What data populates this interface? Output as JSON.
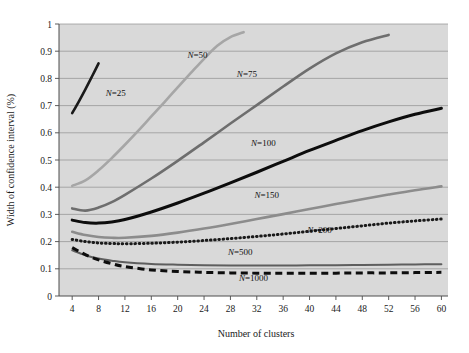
{
  "chart_data": {
    "type": "line",
    "title": "",
    "xlabel": "Number of clusters",
    "ylabel": "Width of confidence interval (%)",
    "xlim": [
      2,
      61
    ],
    "ylim": [
      0,
      1
    ],
    "xticks": [
      4,
      8,
      12,
      16,
      20,
      24,
      28,
      32,
      36,
      40,
      44,
      48,
      52,
      56,
      60
    ],
    "yticks": [
      "0",
      "0.1",
      "0.2",
      "0.3",
      "0.4",
      "0.5",
      "0.6",
      "0.7",
      "0.8",
      "0.9",
      "1"
    ],
    "grid": true,
    "grid_axis": "y",
    "legend": "inline-annotations",
    "plot_background": "#d9d9d9",
    "series": [
      {
        "name": "N=25",
        "label": "N=25",
        "color": "#1a1a1a",
        "style": "solid",
        "width": 2.6,
        "label_x": 10.6,
        "label_y": 0.735,
        "x": [
          4,
          5,
          6,
          7,
          8
        ],
        "values": [
          0.672,
          0.715,
          0.76,
          0.807,
          0.855
        ]
      },
      {
        "name": "N=50",
        "label": "N=50",
        "color": "#a6a6a6",
        "style": "solid",
        "width": 2.6,
        "label_x": 23.0,
        "label_y": 0.875,
        "x": [
          4,
          6,
          8,
          10,
          12,
          14,
          16,
          18,
          20,
          22,
          24,
          26,
          28,
          30
        ],
        "values": [
          0.405,
          0.425,
          0.462,
          0.507,
          0.556,
          0.607,
          0.66,
          0.713,
          0.767,
          0.82,
          0.872,
          0.92,
          0.952,
          0.97
        ]
      },
      {
        "name": "N=75",
        "label": "N=75",
        "color": "#6e6e6e",
        "style": "solid",
        "width": 2.6,
        "label_x": 30.5,
        "label_y": 0.805,
        "x": [
          4,
          6,
          8,
          10,
          12,
          16,
          20,
          24,
          28,
          32,
          36,
          40,
          44,
          48,
          52
        ],
        "values": [
          0.322,
          0.314,
          0.325,
          0.345,
          0.372,
          0.432,
          0.497,
          0.565,
          0.634,
          0.702,
          0.77,
          0.836,
          0.892,
          0.933,
          0.96
        ]
      },
      {
        "name": "N=100",
        "label": "N=100",
        "color": "#0d0d0d",
        "style": "solid",
        "width": 3.0,
        "label_x": 33.0,
        "label_y": 0.552,
        "x": [
          4,
          6,
          8,
          10,
          12,
          16,
          20,
          24,
          28,
          32,
          36,
          40,
          44,
          48,
          52,
          56,
          60
        ],
        "values": [
          0.279,
          0.27,
          0.268,
          0.272,
          0.281,
          0.309,
          0.342,
          0.378,
          0.416,
          0.455,
          0.495,
          0.535,
          0.572,
          0.608,
          0.64,
          0.668,
          0.69
        ]
      },
      {
        "name": "N=150",
        "label": "N=150",
        "color": "#8c8c8c",
        "style": "solid",
        "width": 2.6,
        "label_x": 33.5,
        "label_y": 0.362,
        "x": [
          4,
          6,
          8,
          10,
          12,
          16,
          20,
          24,
          28,
          32,
          36,
          40,
          44,
          48,
          52,
          56,
          60
        ],
        "values": [
          0.236,
          0.224,
          0.217,
          0.214,
          0.214,
          0.221,
          0.233,
          0.248,
          0.265,
          0.283,
          0.301,
          0.32,
          0.338,
          0.356,
          0.373,
          0.389,
          0.403
        ]
      },
      {
        "name": "N=200",
        "label": "N=200",
        "color": "#1a1a1a",
        "style": "dotted",
        "width": 3.0,
        "label_x": 41.5,
        "label_y": 0.232,
        "x": [
          4,
          6,
          8,
          10,
          12,
          16,
          20,
          24,
          28,
          32,
          36,
          40,
          44,
          48,
          52,
          56,
          60
        ],
        "values": [
          0.208,
          0.2,
          0.195,
          0.193,
          0.192,
          0.194,
          0.198,
          0.204,
          0.211,
          0.219,
          0.228,
          0.238,
          0.248,
          0.258,
          0.268,
          0.276,
          0.283
        ]
      },
      {
        "name": "N=500",
        "label": "N=500",
        "color": "#5e5e5e",
        "style": "solid",
        "width": 2.0,
        "label_x": 29.5,
        "label_y": 0.152,
        "x": [
          4,
          6,
          8,
          10,
          12,
          16,
          20,
          24,
          28,
          32,
          36,
          40,
          44,
          48,
          52,
          56,
          60
        ],
        "values": [
          0.168,
          0.15,
          0.138,
          0.13,
          0.124,
          0.118,
          0.115,
          0.113,
          0.112,
          0.112,
          0.112,
          0.113,
          0.113,
          0.114,
          0.115,
          0.116,
          0.117
        ]
      },
      {
        "name": "N=1000",
        "label": "N=1000",
        "color": "#0d0d0d",
        "style": "dashed",
        "width": 3.0,
        "label_x": 31.5,
        "label_y": 0.055,
        "x": [
          4,
          6,
          8,
          10,
          12,
          16,
          20,
          24,
          28,
          32,
          36,
          40,
          44,
          48,
          52,
          56,
          60
        ],
        "values": [
          0.178,
          0.152,
          0.133,
          0.119,
          0.108,
          0.096,
          0.09,
          0.087,
          0.085,
          0.084,
          0.084,
          0.084,
          0.084,
          0.085,
          0.085,
          0.086,
          0.087
        ]
      }
    ]
  }
}
